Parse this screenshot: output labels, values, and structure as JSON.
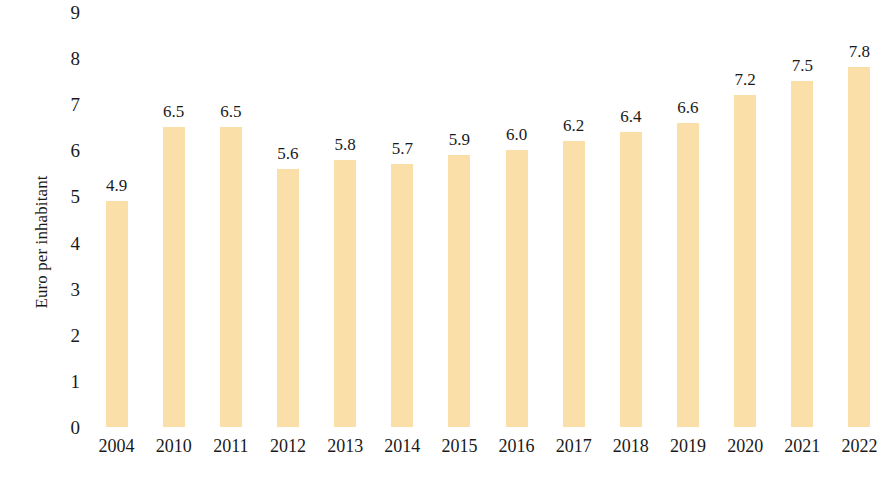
{
  "chart_data": {
    "type": "bar",
    "title": "",
    "subtitle": "",
    "xlabel": "",
    "ylabel": "Euro per inhabitant",
    "categories": [
      "2004",
      "2010",
      "2011",
      "2012",
      "2013",
      "2014",
      "2015",
      "2016",
      "2017",
      "2018",
      "2019",
      "2020",
      "2021",
      "2022"
    ],
    "values": [
      4.9,
      6.5,
      6.5,
      5.6,
      5.8,
      5.7,
      5.9,
      6.0,
      6.2,
      6.4,
      6.6,
      7.2,
      7.5,
      7.8
    ],
    "data_labels": [
      "4.9",
      "6.5",
      "6.5",
      "5.6",
      "5.8",
      "5.7",
      "5.9",
      "6.0",
      "6.2",
      "6.4",
      "6.6",
      "7.2",
      "7.5",
      "7.8"
    ],
    "ylim": [
      0,
      9
    ],
    "ytick_labels": [
      "0",
      "1",
      "2",
      "3",
      "4",
      "5",
      "6",
      "7",
      "8",
      "9"
    ],
    "ytick_values": [
      0,
      1,
      2,
      3,
      4,
      5,
      6,
      7,
      8,
      9
    ],
    "grid": false,
    "legend": false,
    "legend_position": "none",
    "bar_color": "#fadfa8",
    "text_color": "#1a1a1a",
    "background_color": "#ffffff"
  }
}
